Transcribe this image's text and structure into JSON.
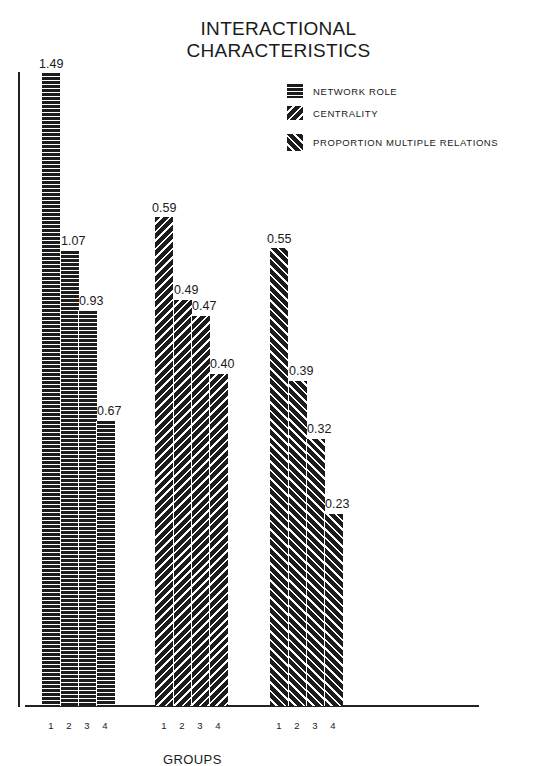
{
  "chart_data": {
    "type": "bar",
    "title": "INTERACTIONAL CHARACTERISTICS",
    "title_lines": [
      "INTERACTIONAL",
      "CHARACTERISTICS"
    ],
    "xlabel": "GROUPS",
    "ylabel": "",
    "categories": [
      "1",
      "2",
      "3",
      "4"
    ],
    "grid": false,
    "legend_position": "top-right",
    "series": [
      {
        "name": "NETWORK ROLE",
        "pattern": "horizontal-lines",
        "values": [
          1.49,
          1.07,
          0.93,
          0.67
        ],
        "value_labels": [
          "1.49",
          "1.07",
          "0.93",
          "0.67"
        ]
      },
      {
        "name": "CENTRALITY",
        "pattern": "diagonal-forward",
        "values": [
          0.59,
          0.49,
          0.47,
          0.4
        ],
        "value_labels": [
          "0.59",
          "0.49",
          "0.47",
          "0.40"
        ]
      },
      {
        "name": "PROPORTION MULTIPLE RELATIONS",
        "pattern": "diagonal-backward",
        "values": [
          0.55,
          0.39,
          0.32,
          0.23
        ],
        "value_labels": [
          "0.55",
          "0.39",
          "0.32",
          "0.23"
        ]
      }
    ]
  },
  "layout": {
    "baseline_y": 706,
    "groups": [
      {
        "x0": 42,
        "bar_w": 18,
        "px_per_unit": 425,
        "cls": "p-h"
      },
      {
        "x0": 155,
        "bar_w": 18,
        "px_per_unit": 829,
        "cls": "p-c"
      },
      {
        "x0": 270,
        "bar_w": 18,
        "px_per_unit": 833,
        "cls": "p-p"
      }
    ]
  }
}
